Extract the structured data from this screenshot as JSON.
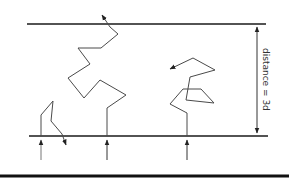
{
  "diagram": {
    "type": "random-walk-across-gap",
    "dimension_label": "distance = 3d",
    "walkers": [
      {
        "name": "left",
        "outcome": "returns-to-origin-side"
      },
      {
        "name": "middle",
        "outcome": "crosses-to-far-side"
      },
      {
        "name": "right",
        "outcome": "wanders-within-gap"
      }
    ],
    "colors": {
      "line": "#1a1a1a",
      "path": "#4a4a4a"
    }
  }
}
